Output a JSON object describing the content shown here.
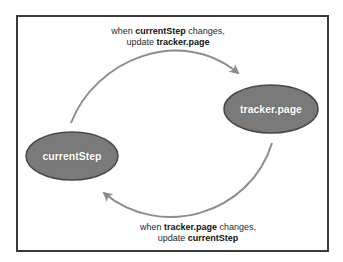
{
  "diagram": {
    "nodes": [
      {
        "id": "currentStep",
        "label": "currentStep"
      },
      {
        "id": "trackerPage",
        "label": "tracker.page"
      }
    ],
    "edges": [
      {
        "from": "currentStep",
        "to": "tracker.page",
        "caption": {
          "line1_prefix": "when ",
          "line1_bold": "currentStep",
          "line1_suffix": " changes,",
          "line2_prefix": "update ",
          "line2_bold": "tracker.page"
        }
      },
      {
        "from": "tracker.page",
        "to": "currentStep",
        "caption": {
          "line1_prefix": "when ",
          "line1_bold": "tracker.page",
          "line1_suffix": " changes,",
          "line2_prefix": "update ",
          "line2_bold": "currentStep"
        }
      }
    ],
    "colors": {
      "node_fill": "#7a7a7a",
      "node_stroke": "#4a4a4a",
      "arrow": "#8c8c8c",
      "frame": "#3a3a3a"
    }
  }
}
